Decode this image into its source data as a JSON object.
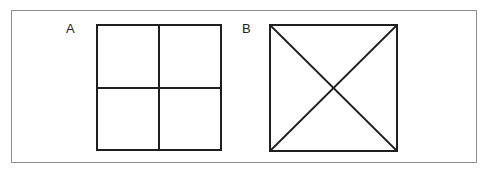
{
  "figure": {
    "canvas": {
      "width": 489,
      "height": 175,
      "background": "#ffffff"
    },
    "frame": {
      "name": "outer-border",
      "x": 11,
      "y": 10,
      "width": 466,
      "height": 153,
      "stroke": "#8d8d8d",
      "stroke_width": 1.5,
      "fill": "#ffffff"
    },
    "line_color": "#1f1f1f",
    "panels": [
      {
        "id": "A",
        "label": "A",
        "label_x": 65,
        "label_y": 21,
        "shape": "square-divided-into-quadrants",
        "description": "Square subdivided by one vertical and one horizontal midline into four equal quadrants",
        "square": {
          "x": 96,
          "y": 24,
          "width": 124,
          "height": 125
        },
        "stroke_width": 2,
        "internal_lines": [
          {
            "name": "vertical-midline",
            "x1": 62,
            "y1": 0,
            "x2": 62,
            "y2": 125
          },
          {
            "name": "horizontal-midline",
            "x1": 0,
            "y1": 63,
            "x2": 124,
            "y2": 63
          }
        ],
        "region_count": 4
      },
      {
        "id": "B",
        "label": "B",
        "label_x": 241,
        "label_y": 21,
        "shape": "square-with-both-diagonals",
        "description": "Square crossed by both corner-to-corner diagonals forming an X, creating four triangles",
        "square": {
          "x": 269,
          "y": 24,
          "width": 127,
          "height": 126
        },
        "stroke_width": 2,
        "internal_lines": [
          {
            "name": "diagonal-tl-br",
            "x1": 0,
            "y1": 0,
            "x2": 127,
            "y2": 126
          },
          {
            "name": "diagonal-tr-bl",
            "x1": 127,
            "y1": 0,
            "x2": 0,
            "y2": 126
          }
        ],
        "region_count": 4
      }
    ]
  }
}
